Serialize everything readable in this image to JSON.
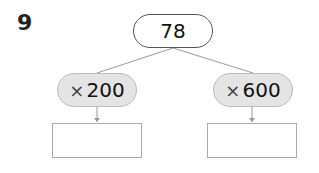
{
  "problem": {
    "number": "9"
  },
  "diagram": {
    "root": {
      "value": "78"
    },
    "branches": [
      {
        "operator": "×",
        "operand": "200",
        "answer": ""
      },
      {
        "operator": "×",
        "operand": "600",
        "answer": ""
      }
    ]
  }
}
